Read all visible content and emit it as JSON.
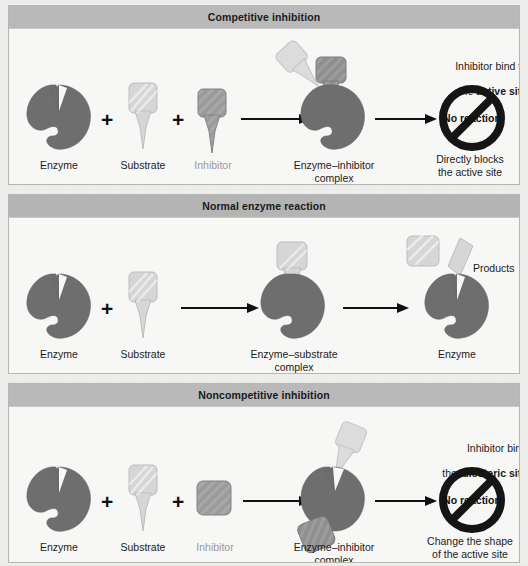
{
  "figure": {
    "colors": {
      "enzyme": "#6e6e6e",
      "enzyme_edge": "#5f5f5f",
      "substrate": "#d3d3d3",
      "substrate_edge": "#b8b8b8",
      "inhibitor_dark": "#9a9a9a",
      "inhibitor_edge": "#7e7e7e",
      "header_bar": "#b9b9b9",
      "panel_bg": "#f7f7f6",
      "page_bg": "#eeeeec",
      "text": "#1b1b1b",
      "muted_text": "#9a9a9a",
      "arrow": "#111111",
      "prohibition": "#151515"
    }
  },
  "panels": [
    {
      "id": "competitive",
      "title": "Competitive inhibition",
      "labels": {
        "enzyme": "Enzyme",
        "substrate": "Substrate",
        "inhibitor": "Inhibitor",
        "complex": "Enzyme–inhibitor\ncomplex",
        "result_top_line1": "Inhibitor bind to",
        "result_top_line2_plain": "the ",
        "result_top_line2_bold": "active site",
        "result_bottom": "Directly blocks\nthe active site",
        "no_reaction": "No reaction",
        "plus1": "+",
        "plus2": "+"
      }
    },
    {
      "id": "normal",
      "title": "Normal enzyme reaction",
      "labels": {
        "enzyme": "Enzyme",
        "substrate": "Substrate",
        "complex": "Enzyme–substrate\ncomplex",
        "enzyme_out": "Enzyme",
        "products": "Products",
        "plus1": "+"
      }
    },
    {
      "id": "noncompetitive",
      "title": "Noncompetitive inhibition",
      "labels": {
        "enzyme": "Enzyme",
        "substrate": "Substrate",
        "inhibitor": "Inhibitor",
        "complex": "Enzyme–inhibitor\ncomplex",
        "result_top_line1": "Inhibitor bind",
        "result_top_line2_plain": "the ",
        "result_top_line2_bold": "allosteric site",
        "result_bottom": "Change the shape\nof the active site",
        "no_reaction": "No reaction",
        "plus1": "+",
        "plus2": "+"
      }
    }
  ]
}
